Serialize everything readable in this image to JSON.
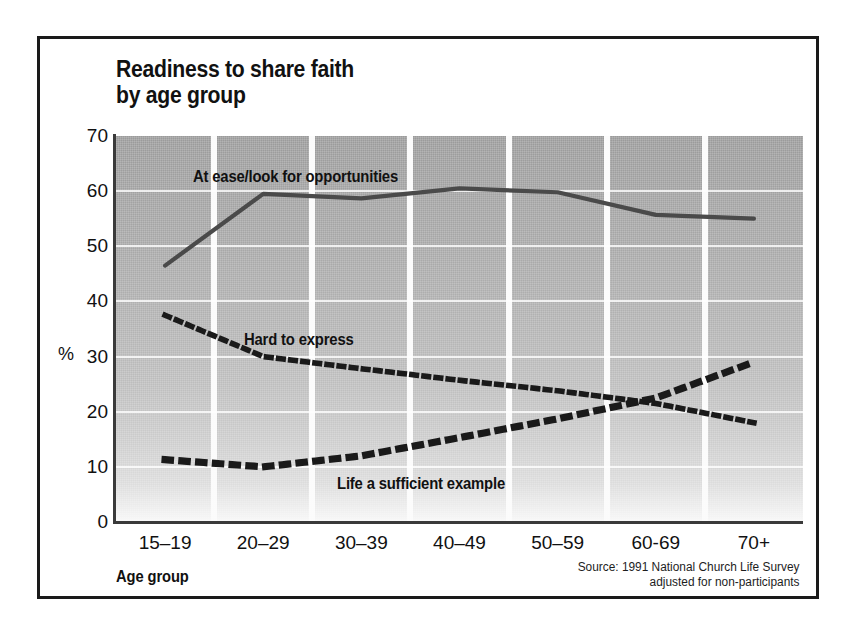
{
  "chart_data": {
    "type": "line",
    "title": "Readiness to share faith by age group",
    "title_lines": [
      "Readiness to share faith",
      "by age group"
    ],
    "xlabel": "Age group",
    "ylabel": "%",
    "ylim": [
      0,
      70
    ],
    "yticks": [
      70,
      60,
      50,
      40,
      30,
      20,
      10,
      0
    ],
    "grid": "horizontal-and-vertical-bands",
    "legend_position": "inline-annotations",
    "categories": [
      "15–19",
      "20–29",
      "30–39",
      "40–49",
      "50–59",
      "60-69",
      "70+"
    ],
    "series": [
      {
        "name": "At ease/look for opportunities",
        "style": "solid",
        "color": "#4a4a4a",
        "values": [
          46.5,
          59.5,
          58.7,
          60.5,
          59.8,
          55.7,
          55.0
        ]
      },
      {
        "name": "Hard to express",
        "style": "dotted",
        "color": "#1a1a1a",
        "values": [
          37.5,
          30.0,
          27.8,
          25.7,
          23.8,
          21.5,
          18.0
        ]
      },
      {
        "name": "Life a sufficient example",
        "style": "dotted-square",
        "color": "#1a1a1a",
        "values": [
          11.3,
          10.0,
          12.0,
          15.3,
          18.7,
          22.5,
          29.0
        ]
      }
    ],
    "source_lines": [
      "Source: 1991 National Church Life Survey",
      "adjusted for non-participants"
    ],
    "annotations": [
      {
        "text": "At ease/look for opportunities",
        "x_px": 193,
        "y_px": 167
      },
      {
        "text": "Hard to express",
        "x_px": 244,
        "y_px": 330
      },
      {
        "text": "Life a sufficient example",
        "x_px": 337,
        "y_px": 474
      }
    ]
  },
  "colors": {
    "frame": "#1a1a1a",
    "axis": "#3a3a3a",
    "plot_top": "#9a9a9a",
    "plot_bottom": "#f8f8f8",
    "gridline": "#fbfbfb",
    "text": "#111111"
  }
}
